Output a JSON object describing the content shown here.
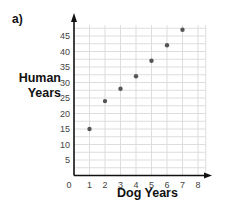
{
  "part_label": "a)",
  "chart_data": {
    "type": "scatter",
    "title": "",
    "xlabel": "Dog Years",
    "ylabel": "Human Years",
    "xlim": [
      0,
      8
    ],
    "ylim": [
      0,
      45
    ],
    "x_ticks": [
      0,
      1,
      2,
      3,
      4,
      5,
      6,
      7,
      8
    ],
    "y_ticks": [
      5,
      10,
      15,
      20,
      25,
      30,
      35,
      40,
      45
    ],
    "grid": true,
    "legend": null,
    "points": [
      {
        "x": 1,
        "y": 15
      },
      {
        "x": 2,
        "y": 24
      },
      {
        "x": 3,
        "y": 28
      },
      {
        "x": 4,
        "y": 32
      },
      {
        "x": 5,
        "y": 37
      },
      {
        "x": 6,
        "y": 42
      },
      {
        "x": 7,
        "y": 47
      }
    ]
  },
  "ylabel_lines": [
    "Human",
    "Years"
  ],
  "colors": {
    "axis": "#111111",
    "grid": "#dddddd",
    "point": "#555555",
    "tick_text": "#444444"
  }
}
